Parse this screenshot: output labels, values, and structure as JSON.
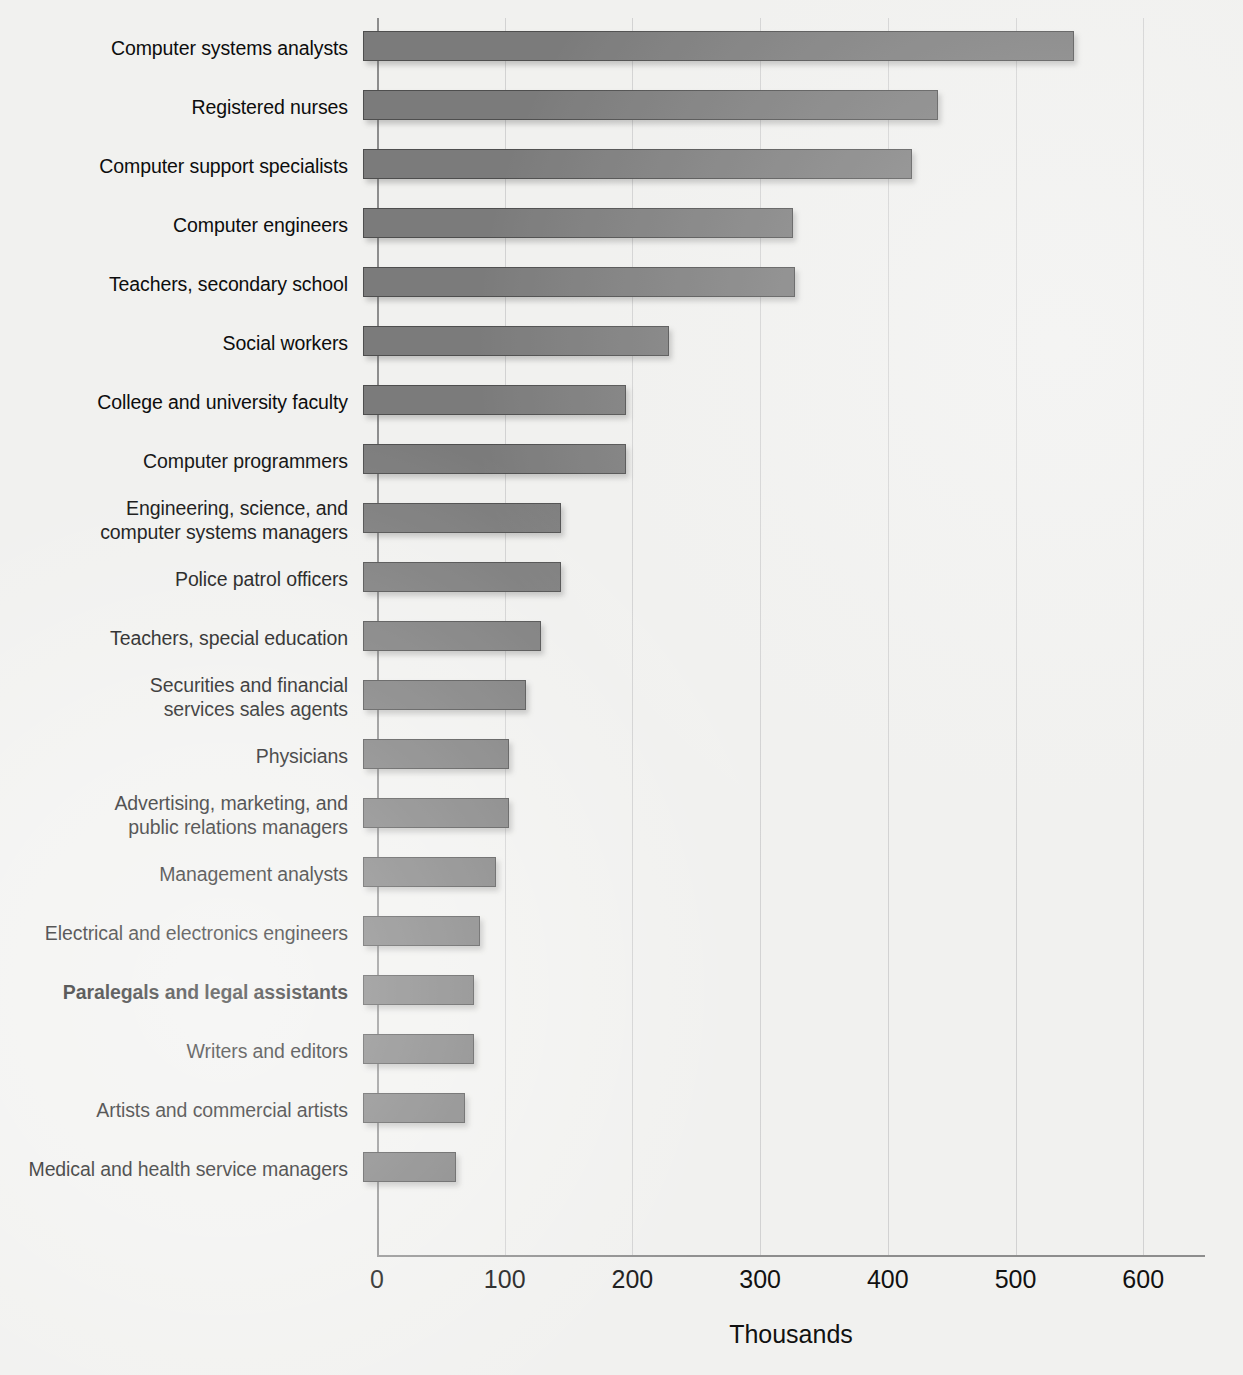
{
  "chart_data": {
    "type": "bar",
    "orientation": "horizontal",
    "title": "",
    "xlabel": "Thousands",
    "ylabel": "",
    "xlim": [
      0,
      650
    ],
    "xticks": [
      0,
      100,
      200,
      300,
      400,
      500,
      600
    ],
    "xtick_labels": [
      "0",
      "100",
      "200",
      "300",
      "400",
      "500",
      "600"
    ],
    "grid": "vertical",
    "legend": "none",
    "categories": [
      "Computer systems analysts",
      "Registered nurses",
      "Computer support specialists",
      "Computer engineers",
      "Teachers, secondary school",
      "Social workers",
      "College and university faculty",
      "Computer programmers",
      "Engineering, science, and\ncomputer systems managers",
      "Police patrol officers",
      "Teachers, special education",
      "Securities and financial\nservices sales agents",
      "Physicians",
      "Advertising, marketing, and\npublic relations managers",
      "Management analysts",
      "Electrical and electronics engineers",
      "Paralegals and legal assistants",
      "Writers and editors",
      "Artists and commercial artists",
      "Medical and health service managers"
    ],
    "values": [
      557,
      450,
      430,
      337,
      338,
      240,
      206,
      206,
      155,
      155,
      139,
      128,
      114,
      114,
      104,
      92,
      87,
      87,
      80,
      73
    ],
    "highlighted": [
      "Paralegals and legal assistants"
    ],
    "colors": {
      "bar_fill": "#7b7b7b",
      "bar_border": "#4e4e4e",
      "background": "#f1f1ef",
      "gridline": "#d2d2d2",
      "axis": "#8d8d8d",
      "text": "#111111"
    }
  },
  "axis": {
    "x_title": "Thousands"
  }
}
